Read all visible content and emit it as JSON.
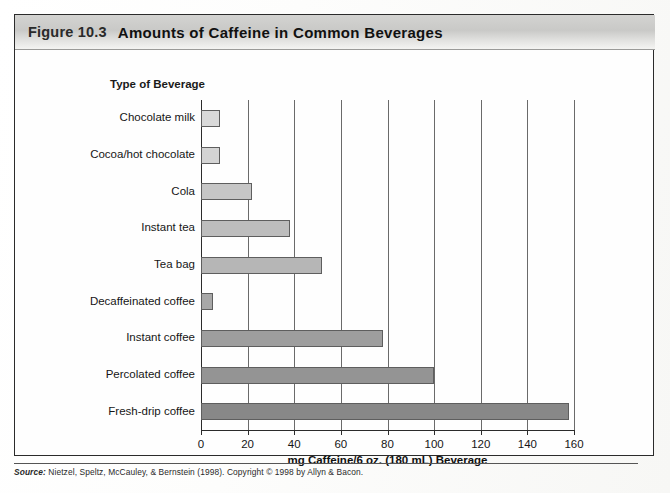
{
  "figure": {
    "number": "Figure 10.3",
    "title": "Amounts of Caffeine in Common Beverages"
  },
  "source": {
    "label": "Source:",
    "text": "Nietzel, Speltz, McCauley, & Bernstein (1998). Copyright © 1998 by Allyn & Bacon."
  },
  "chart_data": {
    "type": "bar",
    "orientation": "horizontal",
    "title": "Amounts of Caffeine in Common Beverages",
    "xlabel": "mg Caffeine/6 oz. (180 mL) Beverage",
    "ylabel": "Type of Beverage",
    "xlim": [
      0,
      160
    ],
    "xticks": [
      0,
      20,
      40,
      60,
      80,
      100,
      120,
      140,
      160
    ],
    "grid": "vertical",
    "legend": "none",
    "categories": [
      "Chocolate milk",
      "Cocoa/hot chocolate",
      "Cola",
      "Instant tea",
      "Tea bag",
      "Decaffeinated coffee",
      "Instant coffee",
      "Percolated coffee",
      "Fresh-drip coffee"
    ],
    "values": [
      8,
      8,
      22,
      38,
      52,
      5,
      78,
      100,
      158
    ],
    "bar_colors": [
      "#d9d9d9",
      "#d4d4d4",
      "#c6c6c6",
      "#bdbdbd",
      "#b6b6b6",
      "#a8a8a8",
      "#9e9e9e",
      "#949494",
      "#888888"
    ]
  }
}
